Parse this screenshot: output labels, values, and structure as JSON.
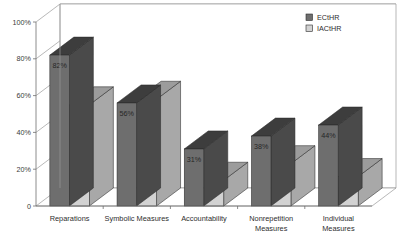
{
  "chart_data": {
    "type": "bar",
    "title": "",
    "subtitle": "",
    "xlabel": "",
    "ylabel": "",
    "categories": [
      "Reparations",
      "Symbolic Measures",
      "Accountability",
      "Nonrepetition Measures",
      "Individual Measures"
    ],
    "series": [
      {
        "name": "ECtHR",
        "values": [
          82,
          56,
          31,
          38,
          44
        ],
        "color": "#6e6e6e"
      },
      {
        "name": "IACtHR",
        "values": [
          55,
          58,
          14,
          23,
          16
        ],
        "color": "#d2d2d2"
      }
    ],
    "value_labels": {
      "ECtHR": [
        "82%",
        "56%",
        "31%",
        "38%",
        "44%"
      ],
      "IACtHR": [
        "55%",
        "58%",
        "14%",
        "23%",
        "16%"
      ]
    },
    "ylim": [
      0,
      100
    ],
    "yticks": [
      0,
      20,
      40,
      60,
      80,
      100
    ],
    "ytick_labels": [
      "0",
      "20%",
      "40%",
      "60%",
      "80%",
      "100%"
    ],
    "grid": true,
    "grid_axis": "y",
    "legend_position": "top-right",
    "three_d": true,
    "style": {
      "background": "#ffffff",
      "gridline_color": "#8d8d8d",
      "axis_color": "#6f6f6f",
      "series_dark": "#6e6e6e",
      "series_light": "#d2d2d2",
      "top_face_dark": "#3d3d3d",
      "top_face_light": "#9c9c9c",
      "side_face_dark": "#4a4a4a",
      "side_face_light": "#a8a8a8",
      "label_color": "#2e2e2e"
    }
  },
  "legend": {
    "entries": [
      {
        "label": "ECtHR",
        "swatch": "#6e6e6e"
      },
      {
        "label": "IACtHR",
        "swatch": "#d2d2d2"
      }
    ]
  }
}
